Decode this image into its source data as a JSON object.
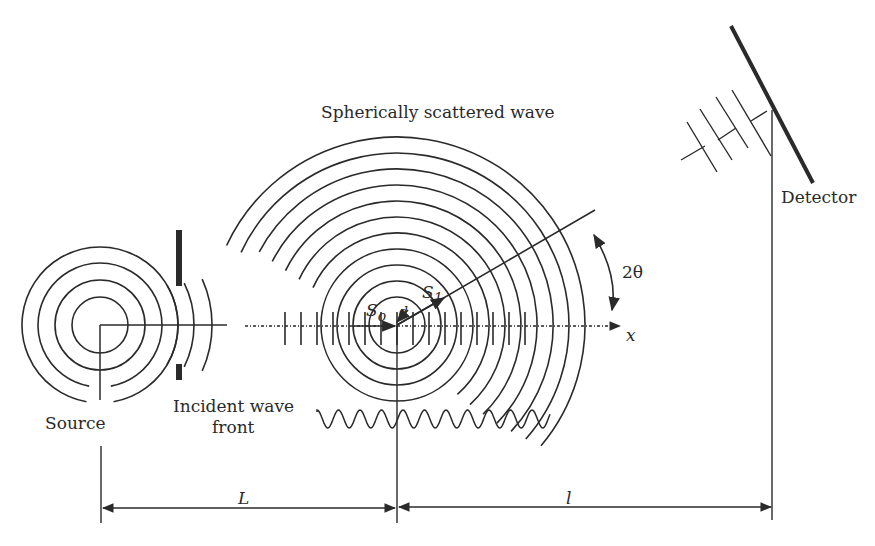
{
  "labels": {
    "title": "Spherically scattered wave",
    "source": "Source",
    "incident_line1": "Incident wave",
    "incident_line2": "front",
    "detector": "Detector",
    "angle": "2θ",
    "x_axis": "x",
    "s0": "S",
    "s0_sub": "o",
    "s1": "S",
    "s1_sub": "1",
    "r_vector": "d",
    "dist_L": "L",
    "dist_l": "l"
  },
  "colors": {
    "stroke": "#2a2a2a",
    "background": "#ffffff"
  },
  "geometry": {
    "source_center": [
      100,
      325
    ],
    "source_radii": [
      28,
      45,
      62,
      78
    ],
    "scatter_center": [
      397,
      325
    ],
    "scatter_radii": [
      28,
      44,
      60,
      76,
      92,
      108,
      124,
      140,
      156,
      172,
      188
    ],
    "detector_line": [
      [
        731,
        26
      ],
      [
        813,
        183
      ]
    ]
  }
}
